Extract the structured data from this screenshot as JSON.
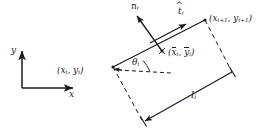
{
  "figure": {
    "background_color": "#ffffff",
    "line_color": "#1a1a1a",
    "axes": {
      "x_label": "x",
      "y_label": "y",
      "origin_px": [
        22,
        88
      ],
      "x_tip_px": [
        74,
        88
      ],
      "y_tip_px": [
        22,
        50
      ]
    },
    "points": {
      "start": {
        "label_main": "(x",
        "label_sub1": "i",
        "label_mid": ", y",
        "label_sub2": "i",
        "label_end": ")",
        "px": [
          113,
          67
        ]
      },
      "end": {
        "label_main": "(x",
        "label_sub1": "i+1",
        "label_mid": ", y",
        "label_sub2": "i+1",
        "label_end": ")",
        "px": [
          205,
          20
        ]
      },
      "midpoint": {
        "label_open": "(",
        "label_xbar": "x",
        "label_xsub": "i",
        "label_comma": ", ",
        "label_ybar": "y",
        "label_ysub": "i",
        "label_close": ")",
        "px": [
          162,
          51
        ]
      }
    },
    "vectors": {
      "normal": {
        "symbol": "n",
        "subscript": "i",
        "tip_px": [
          136,
          15
        ],
        "tail_px": [
          162,
          51
        ]
      },
      "tangent": {
        "symbol": "t",
        "subscript": "i",
        "tip_px": [
          187,
          24
        ],
        "tail_px": [
          150,
          43
        ]
      }
    },
    "angle": {
      "symbol": "θ",
      "subscript": "i",
      "vertex_px": [
        113,
        67
      ],
      "reference_end_px": [
        170,
        73
      ]
    },
    "length": {
      "symbol": "l",
      "subscript": "i",
      "arrow_start_px": [
        143,
        122
      ],
      "arrow_end_px": [
        232,
        72
      ]
    }
  }
}
